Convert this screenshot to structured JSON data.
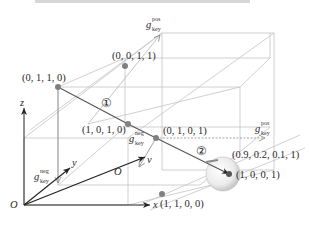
{
  "header": {
    "cropped_caption_text": ""
  },
  "axes": {
    "origin_main": "O",
    "x": "x",
    "y": "y",
    "z": "z",
    "origin_inner": "O",
    "v": "v"
  },
  "vectors": {
    "g_pos_top": {
      "base": "g",
      "sup": "pos",
      "sub": "key"
    },
    "g_pos_right": {
      "base": "g",
      "sup": "pos",
      "sub": "key"
    },
    "g_neg_center": {
      "base": "g",
      "sup": "neg",
      "sub": "key"
    },
    "g_neg_left": {
      "base": "g",
      "sup": "neg",
      "sub": "key"
    }
  },
  "points": [
    {
      "id": "p0011",
      "label": "(0, 0, 1, 1)"
    },
    {
      "id": "p0110",
      "label": "(0, 1, 1, 0)"
    },
    {
      "id": "p1010",
      "label": "(1, 0, 1, 0)"
    },
    {
      "id": "p0101",
      "label": "(0, 1, 0, 1)"
    },
    {
      "id": "p0921",
      "label": "(0.9, 0.2, 0.1, 1)"
    },
    {
      "id": "p1001",
      "label": "(1, 0, 0, 1)"
    },
    {
      "id": "p1100",
      "label": "(1, 1, 0, 0)"
    }
  ],
  "markers": {
    "step1": "①",
    "step2": "②"
  },
  "colors": {
    "cube_line": "#c4c4c4",
    "dark_line": "#555555",
    "point_fill": "#808080",
    "axis": "#222222",
    "sphere": "#d9d9d9"
  }
}
